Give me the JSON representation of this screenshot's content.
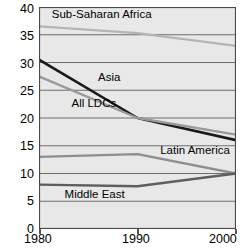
{
  "chart_data": {
    "type": "line",
    "title": "",
    "subtitle": "",
    "xlabel": "",
    "ylabel": "",
    "x": [
      1980,
      1990,
      2000
    ],
    "xtick_labels": [
      "1980",
      "1990",
      "2000"
    ],
    "ytick_labels": [
      "0",
      "5",
      "10",
      "15",
      "20",
      "25",
      "30",
      "35",
      "40"
    ],
    "ytick_values": [
      0,
      5,
      10,
      15,
      20,
      25,
      30,
      35,
      40
    ],
    "ylim": [
      0,
      40
    ],
    "xlim": [
      1980,
      2000
    ],
    "grid": "horizontal",
    "legend": "inline-labels",
    "series": [
      {
        "name": "Sub-Saharan Africa",
        "values": [
          36.5,
          35.3,
          33.0
        ],
        "color": "#b4b4b4",
        "label_x": 1981.3,
        "label_y": 38.6
      },
      {
        "name": "Asia",
        "values": [
          30.5,
          20.0,
          16.0
        ],
        "color": "#1a1a1a",
        "label_x": 1986.0,
        "label_y": 27.3
      },
      {
        "name": "All LDCs",
        "values": [
          27.5,
          20.0,
          17.0
        ],
        "color": "#9a9a9a",
        "label_x": 1983.3,
        "label_y": 22.6
      },
      {
        "name": "Latin America",
        "values": [
          13.0,
          13.5,
          10.0
        ],
        "color": "#8e8e8e",
        "label_x": 1992.3,
        "label_y": 14.1
      },
      {
        "name": "Middle East",
        "values": [
          8.0,
          7.7,
          10.0
        ],
        "color": "#5e5e5e",
        "label_x": 1982.6,
        "label_y": 6.2
      }
    ]
  },
  "axis": {
    "y_labels": [
      "40",
      "35",
      "30",
      "25",
      "20",
      "15",
      "10",
      "5",
      "0"
    ],
    "x_labels": [
      "1980",
      "1990",
      "2000"
    ]
  },
  "series_labels": {
    "ssa": "Sub-Saharan Africa",
    "asia": "Asia",
    "all_ldcs": "All LDCs",
    "latin_america": "Latin America",
    "middle_east": "Middle East"
  },
  "colors": {
    "plot_background": "#e8e8e8",
    "page_background": "#ffffff",
    "gridline": "#6e6e6e",
    "axis": "#4a4a4a",
    "text": "#000000"
  }
}
